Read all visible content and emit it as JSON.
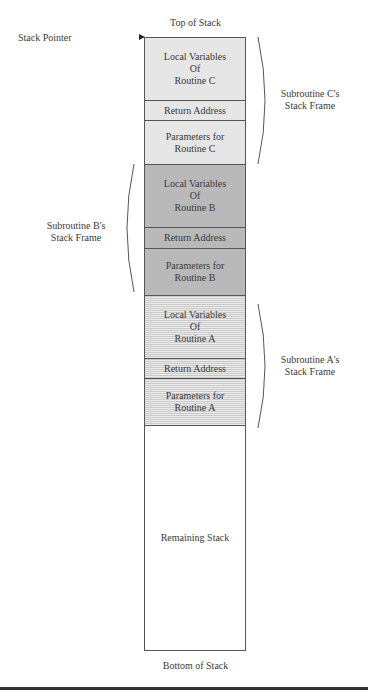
{
  "diagram": {
    "title_top": "Top of Stack",
    "title_bottom": "Bottom of Stack",
    "stack_pointer_label": "Stack Pointer",
    "cells": [
      {
        "label": "Local Variables\nOf\nRoutine C",
        "frame": "C",
        "kind": "locals"
      },
      {
        "label": "Return Address",
        "frame": "C",
        "kind": "return"
      },
      {
        "label": "Parameters for\nRoutine C",
        "frame": "C",
        "kind": "params"
      },
      {
        "label": "Local Variables\nOf\nRoutine B",
        "frame": "B",
        "kind": "locals"
      },
      {
        "label": "Return Address",
        "frame": "B",
        "kind": "return"
      },
      {
        "label": "Parameters for\nRoutine B",
        "frame": "B",
        "kind": "params"
      },
      {
        "label": "Local Variables\nOf\nRoutine A",
        "frame": "A",
        "kind": "locals"
      },
      {
        "label": "Return Address",
        "frame": "A",
        "kind": "return"
      },
      {
        "label": "Parameters for\nRoutine A",
        "frame": "A",
        "kind": "params"
      },
      {
        "label": "Remaining Stack",
        "frame": "",
        "kind": "remaining"
      }
    ],
    "frames": {
      "C": {
        "label": "Subroutine C's\nStack Frame",
        "side": "right",
        "fill": "#e6e6e6"
      },
      "B": {
        "label": "Subroutine B's\nStack Frame",
        "side": "left",
        "fill": "#b9b9b9"
      },
      "A": {
        "label": "Subroutine A's\nStack Frame",
        "side": "right",
        "fill": "striped-gray"
      }
    }
  }
}
